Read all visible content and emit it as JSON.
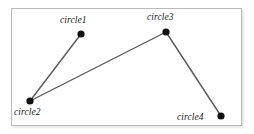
{
  "figure": {
    "type": "node-link-diagram",
    "background_color": "#ffffff",
    "frame": {
      "x": 11,
      "y": 8,
      "width": 231,
      "height": 118,
      "border_color": "#b9b9b9",
      "fill_color": "#ffffff"
    },
    "node_color": "#111111",
    "node_radius": 3.6,
    "edge_color": "#595959",
    "edge_width": 1.4,
    "label_color": "#1a1a1a"
  },
  "nodes": [
    {
      "id": "circle1",
      "label": "circle1",
      "cx": 81,
      "cy": 34,
      "label_x": 60,
      "label_y": 15,
      "label_position": "above-left"
    },
    {
      "id": "circle2",
      "label": "circle2",
      "cx": 30,
      "cy": 101,
      "label_x": 14,
      "label_y": 107,
      "label_position": "below-left"
    },
    {
      "id": "circle3",
      "label": "circle3",
      "cx": 166,
      "cy": 32,
      "label_x": 147,
      "label_y": 12,
      "label_position": "above"
    },
    {
      "id": "circle4",
      "label": "circle4",
      "cx": 221,
      "cy": 116,
      "label_x": 177,
      "label_y": 112,
      "label_position": "left"
    }
  ],
  "edges": [
    {
      "id": "edge-circle1-circle2",
      "from": "circle1",
      "to": "circle2",
      "x1": 81,
      "y1": 34,
      "x2": 30,
      "y2": 101
    },
    {
      "id": "edge-circle2-circle3",
      "from": "circle2",
      "to": "circle3",
      "x1": 30,
      "y1": 101,
      "x2": 166,
      "y2": 32
    },
    {
      "id": "edge-circle3-circle4",
      "from": "circle3",
      "to": "circle4",
      "x1": 166,
      "y1": 32,
      "x2": 221,
      "y2": 116
    }
  ]
}
